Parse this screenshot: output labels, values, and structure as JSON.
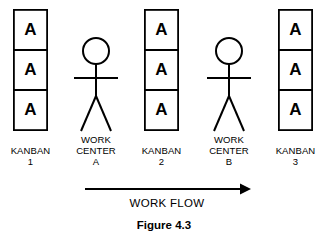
{
  "figure": {
    "caption": "Figure 4.3",
    "background_color": "#ffffff",
    "line_color": "#000000",
    "width": 324,
    "height": 236
  },
  "flow": {
    "label": "WORK FLOW",
    "direction": "left-to-right",
    "arrow_start_x": 85,
    "arrow_end_x": 250,
    "arrow_y": 189
  },
  "kanban_stacks": [
    {
      "id": "kanban-1",
      "label_line1": "KANBAN",
      "label_line2": "1",
      "cards": [
        "A",
        "A",
        "A"
      ],
      "x": 13,
      "y": 9,
      "width": 35,
      "height": 122,
      "center_x": 30.5
    },
    {
      "id": "kanban-2",
      "label_line1": "KANBAN",
      "label_line2": "2",
      "cards": [
        "A",
        "A",
        "A"
      ],
      "x": 144,
      "y": 9,
      "width": 35,
      "height": 122,
      "center_x": 161.5
    },
    {
      "id": "kanban-3",
      "label_line1": "KANBAN",
      "label_line2": "3",
      "cards": [
        "A",
        "A",
        "A"
      ],
      "x": 278,
      "y": 9,
      "width": 35,
      "height": 122,
      "center_x": 295.5
    }
  ],
  "work_centers": [
    {
      "id": "work-center-a",
      "label_line1": "WORK",
      "label_line2": "CENTER",
      "label_line3": "A",
      "center_x": 96,
      "head_center_y": 51,
      "head_radius": 13,
      "arms_y": 78,
      "arms_half_width": 22,
      "body_bottom_y": 96,
      "legs_bottom_y": 131,
      "legs_half_width": 15
    },
    {
      "id": "work-center-b",
      "label_line1": "WORK",
      "label_line2": "CENTER",
      "label_line3": "B",
      "center_x": 229,
      "head_center_y": 51,
      "head_radius": 13,
      "arms_y": 78,
      "arms_half_width": 22,
      "body_bottom_y": 96,
      "legs_bottom_y": 131,
      "legs_half_width": 15
    }
  ],
  "label_rows": {
    "line1_y": 151,
    "line2_y": 161,
    "line3_y": 171,
    "kanban_line1_y": 151,
    "kanban_line2_y": 161
  },
  "text_positions": {
    "flow_label_y": 206,
    "caption_y": 228
  }
}
